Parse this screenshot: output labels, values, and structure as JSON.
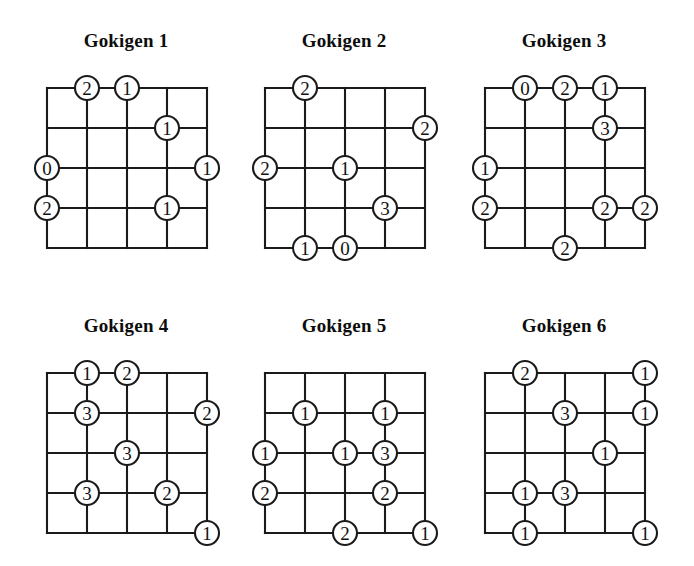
{
  "sheet": {
    "background_color": "#ffffff",
    "ink_color": "#1a1a1a",
    "puzzle_count": 6,
    "grid_cells": 4,
    "lattice_points": 5
  },
  "layout": {
    "columns": 3,
    "rows": 2,
    "cell_size": 40,
    "circle_radius": 12
  },
  "puzzles": [
    {
      "id": "gokigen-1",
      "title": "Gokigen 1",
      "title_x": 47,
      "title_y": 30,
      "title_width": 158,
      "grid_x": 47,
      "grid_y": 88,
      "clues": [
        {
          "col": 1,
          "row": 0,
          "value": "2"
        },
        {
          "col": 2,
          "row": 0,
          "value": "1"
        },
        {
          "col": 3,
          "row": 1,
          "value": "1"
        },
        {
          "col": 0,
          "row": 2,
          "value": "0"
        },
        {
          "col": 4,
          "row": 2,
          "value": "1"
        },
        {
          "col": 0,
          "row": 3,
          "value": "2"
        },
        {
          "col": 3,
          "row": 3,
          "value": "1"
        }
      ]
    },
    {
      "id": "gokigen-2",
      "title": "Gokigen 2",
      "title_x": 265,
      "title_y": 30,
      "title_width": 158,
      "grid_x": 265,
      "grid_y": 88,
      "clues": [
        {
          "col": 1,
          "row": 0,
          "value": "2"
        },
        {
          "col": 4,
          "row": 1,
          "value": "2"
        },
        {
          "col": 0,
          "row": 2,
          "value": "2"
        },
        {
          "col": 2,
          "row": 2,
          "value": "1"
        },
        {
          "col": 3,
          "row": 3,
          "value": "3"
        },
        {
          "col": 1,
          "row": 4,
          "value": "1"
        },
        {
          "col": 2,
          "row": 4,
          "value": "0"
        }
      ]
    },
    {
      "id": "gokigen-3",
      "title": "Gokigen 3",
      "title_x": 485,
      "title_y": 30,
      "title_width": 158,
      "grid_x": 485,
      "grid_y": 88,
      "clues": [
        {
          "col": 1,
          "row": 0,
          "value": "0"
        },
        {
          "col": 2,
          "row": 0,
          "value": "2"
        },
        {
          "col": 3,
          "row": 0,
          "value": "1"
        },
        {
          "col": 3,
          "row": 1,
          "value": "3"
        },
        {
          "col": 0,
          "row": 2,
          "value": "1"
        },
        {
          "col": 0,
          "row": 3,
          "value": "2"
        },
        {
          "col": 3,
          "row": 3,
          "value": "2"
        },
        {
          "col": 4,
          "row": 3,
          "value": "2"
        },
        {
          "col": 2,
          "row": 4,
          "value": "2"
        }
      ]
    },
    {
      "id": "gokigen-4",
      "title": "Gokigen 4",
      "title_x": 47,
      "title_y": 315,
      "title_width": 158,
      "grid_x": 47,
      "grid_y": 373,
      "clues": [
        {
          "col": 1,
          "row": 0,
          "value": "1"
        },
        {
          "col": 2,
          "row": 0,
          "value": "2"
        },
        {
          "col": 1,
          "row": 1,
          "value": "3"
        },
        {
          "col": 4,
          "row": 1,
          "value": "2"
        },
        {
          "col": 2,
          "row": 2,
          "value": "3"
        },
        {
          "col": 1,
          "row": 3,
          "value": "3"
        },
        {
          "col": 3,
          "row": 3,
          "value": "2"
        },
        {
          "col": 4,
          "row": 4,
          "value": "1"
        }
      ]
    },
    {
      "id": "gokigen-5",
      "title": "Gokigen 5",
      "title_x": 265,
      "title_y": 315,
      "title_width": 158,
      "grid_x": 265,
      "grid_y": 373,
      "clues": [
        {
          "col": 1,
          "row": 1,
          "value": "1"
        },
        {
          "col": 3,
          "row": 1,
          "value": "1"
        },
        {
          "col": 0,
          "row": 2,
          "value": "1"
        },
        {
          "col": 2,
          "row": 2,
          "value": "1"
        },
        {
          "col": 3,
          "row": 2,
          "value": "3"
        },
        {
          "col": 0,
          "row": 3,
          "value": "2"
        },
        {
          "col": 3,
          "row": 3,
          "value": "2"
        },
        {
          "col": 2,
          "row": 4,
          "value": "2"
        },
        {
          "col": 4,
          "row": 4,
          "value": "1"
        }
      ]
    },
    {
      "id": "gokigen-6",
      "title": "Gokigen 6",
      "title_x": 485,
      "title_y": 315,
      "title_width": 158,
      "grid_x": 485,
      "grid_y": 373,
      "clues": [
        {
          "col": 1,
          "row": 0,
          "value": "2"
        },
        {
          "col": 4,
          "row": 0,
          "value": "1"
        },
        {
          "col": 2,
          "row": 1,
          "value": "3"
        },
        {
          "col": 4,
          "row": 1,
          "value": "1"
        },
        {
          "col": 3,
          "row": 2,
          "value": "1"
        },
        {
          "col": 1,
          "row": 3,
          "value": "1"
        },
        {
          "col": 2,
          "row": 3,
          "value": "3"
        },
        {
          "col": 1,
          "row": 4,
          "value": "1"
        },
        {
          "col": 4,
          "row": 4,
          "value": "1"
        }
      ]
    }
  ]
}
